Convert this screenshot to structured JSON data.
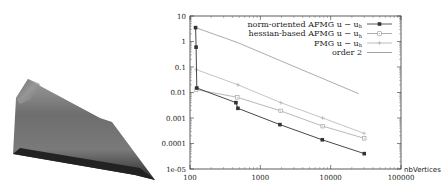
{
  "figure": {
    "left_panel": {
      "description": "3D shaded surface plot of solution over triangular domain"
    }
  },
  "chart_data": {
    "type": "line",
    "title": "",
    "xlabel": "nbVertices",
    "ylabel": "",
    "xscale": "log",
    "yscale": "log",
    "xlim": [
      100,
      100000
    ],
    "ylim": [
      1e-05,
      10
    ],
    "x_ticks": [
      "100",
      "1000",
      "10000",
      "100000"
    ],
    "y_ticks": [
      "10",
      "1",
      "0.1",
      "0.01",
      "0.001",
      "0.0001",
      "1e-05"
    ],
    "grid": false,
    "legend_position": "top-right",
    "series": [
      {
        "name": "norm-oriented AFMG u − u_h",
        "color": "#333333",
        "marker": "filled-square",
        "points": [
          [
            120,
            3.5
          ],
          [
            122,
            0.6
          ],
          [
            125,
            0.015
          ],
          [
            450,
            0.004
          ],
          [
            480,
            0.0024
          ],
          [
            1900,
            0.00055
          ],
          [
            7600,
            0.00014
          ],
          [
            30000,
            4e-05
          ]
        ]
      },
      {
        "name": "hessian-based AFMG u − u_h",
        "color": "#999999",
        "marker": "open-square",
        "points": [
          [
            122,
            0.013
          ],
          [
            470,
            0.0065
          ],
          [
            1950,
            0.0019
          ],
          [
            7700,
            0.00048
          ],
          [
            30000,
            0.00016
          ]
        ]
      },
      {
        "name": "FMG u − u_h",
        "color": "#aaaaaa",
        "marker": "plus",
        "points": [
          [
            122,
            0.08
          ],
          [
            480,
            0.02
          ],
          [
            1950,
            0.004
          ],
          [
            7700,
            0.001
          ],
          [
            30000,
            0.00025
          ]
        ]
      },
      {
        "name": "order 2",
        "color": "#888888",
        "marker": "none",
        "points": [
          [
            120,
            3.5
          ],
          [
            480,
            0.9
          ],
          [
            1900,
            0.18
          ],
          [
            25000,
            0.009
          ]
        ]
      }
    ],
    "legend": [
      "norm-oriented AFMG u − u_h",
      "hessian-based AFMG u − u_h",
      "FMG u − u_h",
      "order 2"
    ]
  },
  "legend_labels": {
    "s0_prefix": "norm-oriented AFMG",
    "s1_prefix": "hessian-based AFMG",
    "s2_prefix": "FMG",
    "s3": "order 2",
    "expr": "u − u",
    "sub": "h"
  },
  "axis": {
    "xlabel": "nbVertices",
    "x_ticks": [
      "100",
      "1000",
      "10000",
      "100000"
    ],
    "y_ticks": [
      "10",
      "1",
      "0.1",
      "0.01",
      "0.001",
      "0.0001",
      "1e-05"
    ]
  }
}
